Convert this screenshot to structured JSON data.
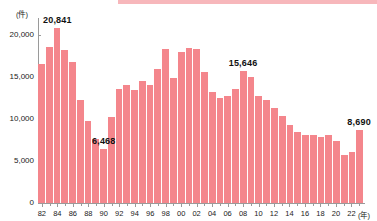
{
  "chart_data": {
    "type": "bar",
    "title": "",
    "subtitle": "",
    "xlabel": "(年)",
    "ylabel": "(件)",
    "ylim": [
      0,
      22000
    ],
    "grid": false,
    "legend": null,
    "bar_color": "#f4868c",
    "y_ticks": [
      "0",
      "5,000",
      "10,000",
      "15,000",
      "20,000"
    ],
    "y_tick_values": [
      0,
      5000,
      10000,
      15000,
      20000
    ],
    "x_tick_labels": [
      "82",
      "84",
      "86",
      "88",
      "90",
      "92",
      "94",
      "96",
      "98",
      "00",
      "02",
      "04",
      "06",
      "08",
      "10",
      "12",
      "14",
      "16",
      "18",
      "20",
      "22"
    ],
    "categories": [
      "82",
      "83",
      "84",
      "85",
      "86",
      "87",
      "88",
      "89",
      "90",
      "91",
      "92",
      "93",
      "94",
      "95",
      "96",
      "97",
      "98",
      "99",
      "00",
      "01",
      "02",
      "03",
      "04",
      "05",
      "06",
      "07",
      "08",
      "09",
      "10",
      "11",
      "12",
      "13",
      "14",
      "15",
      "16",
      "17",
      "18",
      "19",
      "20",
      "21",
      "22",
      "23"
    ],
    "values": [
      16540,
      18540,
      20841,
      18150,
      16800,
      12200,
      9720,
      7650,
      6468,
      10250,
      13500,
      14000,
      13450,
      14550,
      14000,
      15900,
      18300,
      14850,
      18000,
      18450,
      18350,
      15600,
      13200,
      12500,
      12700,
      13550,
      15646,
      14950,
      12750,
      12200,
      11350,
      10400,
      9250,
      8450,
      8050,
      8050,
      7850,
      8050,
      7350,
      5700,
      6050,
      8690
    ],
    "annotations": [
      {
        "label": "20,841",
        "category": "84",
        "value": 20841
      },
      {
        "label": "6,468",
        "category": "90",
        "value": 6468
      },
      {
        "label": "15,646",
        "category": "08",
        "value": 15646
      },
      {
        "label": "8,690",
        "category": "23",
        "value": 8690
      }
    ]
  }
}
